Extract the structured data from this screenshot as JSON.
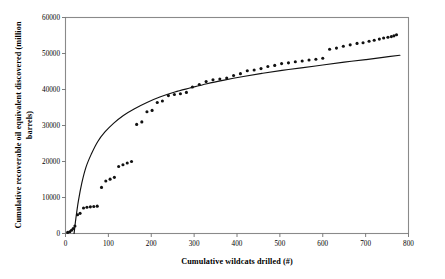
{
  "chart_data": {
    "type": "scatter",
    "title": "",
    "xlabel": "Cumulative wildcats drilled (#)",
    "ylabel": "Cumulative recoverable oil equivalent discovered (million barrels)",
    "ylabel_line1": "Cumulative recoverable oil equivalent discovered (million",
    "ylabel_line2": "barrels)",
    "xlim": [
      0,
      800
    ],
    "ylim": [
      0,
      60000
    ],
    "xticks": [
      0,
      100,
      200,
      300,
      400,
      500,
      600,
      700,
      800
    ],
    "xtick_labels": [
      "0",
      "100",
      "200",
      "300",
      "400",
      "500",
      "600",
      "700",
      "800"
    ],
    "yticks": [
      0,
      10000,
      20000,
      30000,
      40000,
      50000,
      60000
    ],
    "ytick_labels": [
      "0",
      "10000",
      "20000",
      "30000",
      "40000",
      "50000",
      "60000"
    ],
    "grid": false,
    "legend": "none",
    "marker_color": "#111111",
    "curve_color": "#111111",
    "frame_color": "#8a8a8a",
    "series": [
      {
        "name": "Cumulative discovery (observed)",
        "type": "scatter",
        "x": [
          5,
          10,
          14,
          18,
          22,
          28,
          34,
          42,
          50,
          58,
          66,
          74,
          84,
          94,
          104,
          114,
          124,
          134,
          144,
          154,
          166,
          178,
          190,
          202,
          214,
          226,
          240,
          254,
          268,
          282,
          296,
          312,
          328,
          344,
          360,
          376,
          392,
          408,
          424,
          440,
          456,
          472,
          488,
          504,
          520,
          536,
          552,
          568,
          584,
          600,
          616,
          632,
          648,
          664,
          680,
          694,
          708,
          720,
          732,
          742,
          752,
          760,
          766,
          772
        ],
        "y": [
          300,
          500,
          900,
          1400,
          2100,
          5200,
          5600,
          7100,
          7300,
          7400,
          7500,
          7600,
          12800,
          14600,
          15100,
          15600,
          18600,
          19100,
          19600,
          20000,
          30300,
          31000,
          33800,
          34200,
          36400,
          36800,
          38300,
          38600,
          38800,
          39200,
          40700,
          41400,
          42200,
          42700,
          42900,
          43200,
          43900,
          44400,
          45200,
          45400,
          45800,
          46400,
          46700,
          47200,
          47400,
          47700,
          47900,
          48200,
          48400,
          48700,
          51200,
          51500,
          52000,
          52400,
          52800,
          53000,
          53400,
          53700,
          54000,
          54300,
          54500,
          54700,
          54900,
          55200
        ]
      },
      {
        "name": "Fitted discovery curve",
        "type": "line",
        "x": [
          20,
          24,
          30,
          38,
          48,
          60,
          75,
          92,
          112,
          135,
          160,
          190,
          220,
          255,
          290,
          330,
          370,
          415,
          460,
          505,
          550,
          600,
          650,
          700,
          745,
          780
        ],
        "y": [
          0,
          4000,
          9000,
          14000,
          18500,
          22000,
          25500,
          28200,
          30600,
          32800,
          34600,
          36400,
          37900,
          39300,
          40400,
          41600,
          42600,
          43600,
          44500,
          45300,
          46000,
          46800,
          47600,
          48300,
          49000,
          49500
        ]
      }
    ]
  },
  "axes": {
    "x_title": "Cumulative wildcats drilled (#)",
    "y_title_line1": "Cumulative recoverable oil equivalent discovered (million",
    "y_title_line2": "barrels)"
  }
}
